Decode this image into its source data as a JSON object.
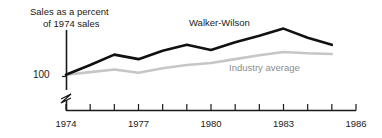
{
  "chart_data": {
    "type": "line",
    "title": "",
    "ylabel": "Sales as a percent of 1974 sales",
    "ylabel_line1": "Sales as a percent",
    "ylabel_line2": "of 1974 sales",
    "xlabel": "",
    "grid": false,
    "legend": "inline-annotations",
    "y_axis_break": true,
    "y_tick_labels": [
      "100"
    ],
    "y_tick_values": [
      100
    ],
    "ylim": [
      95,
      175
    ],
    "xlim": [
      1974,
      1986
    ],
    "x": [
      1974,
      1975,
      1976,
      1977,
      1978,
      1979,
      1980,
      1981,
      1982,
      1983,
      1984,
      1985
    ],
    "x_tick_values": [
      1974,
      1975,
      1976,
      1977,
      1978,
      1979,
      1980,
      1981,
      1982,
      1983,
      1984,
      1985,
      1986
    ],
    "x_tick_labels": [
      "1974",
      "",
      "",
      "1977",
      "",
      "",
      "1980",
      "",
      "",
      "1983",
      "",
      "",
      "1986"
    ],
    "x_major_labels": [
      "1974",
      "1977",
      "1980",
      "1983",
      "1986"
    ],
    "series": [
      {
        "name": "Walker-Wilson",
        "color": "#111111",
        "values": [
          100,
          115,
          131,
          124,
          137,
          146,
          138,
          150,
          160,
          171,
          157,
          146
        ]
      },
      {
        "name": "Industry average",
        "color": "#c6c6c6",
        "values": [
          100,
          104,
          108,
          103,
          110,
          115,
          118,
          124,
          130,
          135,
          133,
          132
        ]
      }
    ]
  },
  "colors": {
    "axis": "#1a1a1a",
    "background": "#ffffff",
    "series_dark": "#111111",
    "series_light": "#c6c6c6",
    "label_dark": "#1a1a1a",
    "label_light": "#8d8d8d"
  }
}
